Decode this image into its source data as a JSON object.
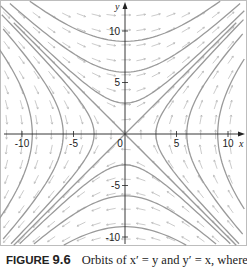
{
  "figure": {
    "label": "FIGURE",
    "number": "9.6",
    "caption_text": "Orbits of x′ = y and y′ = x, where"
  },
  "chart_data": {
    "type": "phase_portrait",
    "system": {
      "dx": "y",
      "dy": "x"
    },
    "xlabel": "x",
    "ylabel": "y",
    "xlim": [
      -12,
      12
    ],
    "ylim": [
      -10.5,
      12.5
    ],
    "x_ticks": [
      -10,
      -5,
      0,
      5,
      10
    ],
    "y_ticks": [
      -10,
      -5,
      5,
      10
    ],
    "x_tick_labels": [
      "-10",
      "-5",
      "0",
      "5",
      "10"
    ],
    "y_tick_labels": [
      "-10",
      "-5",
      "5",
      "10"
    ],
    "separatrices": [
      "y = x",
      "y = -x"
    ],
    "orbit_levels_x2_minus_y2": [
      -81,
      -36,
      -9,
      9,
      36,
      81
    ],
    "direction_field": true,
    "grid": false,
    "colors": {
      "orbit": "#9a9a9a",
      "arrow": "#b5b5b5",
      "axis": "#222222",
      "frame": "#bdbdbd"
    }
  }
}
